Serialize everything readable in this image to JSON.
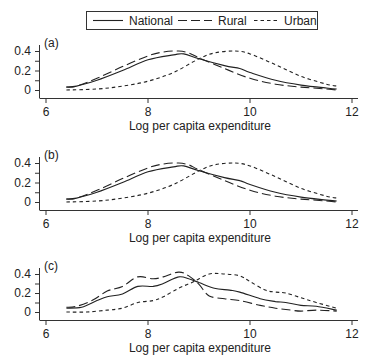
{
  "legend": {
    "entries": [
      {
        "name": "National",
        "style": "solid"
      },
      {
        "name": "Rural",
        "style": "long-dash"
      },
      {
        "name": "Urban",
        "style": "short-dash"
      }
    ]
  },
  "chart_data": [
    {
      "type": "line",
      "panel_label": "(a)",
      "title": "",
      "xlabel": "Log per capita expenditure",
      "ylabel": "",
      "xlim": [
        6,
        12
      ],
      "ylim": [
        0,
        0.4
      ],
      "x_ticks": [
        6,
        8,
        10,
        12
      ],
      "y_ticks": [
        0,
        0.2,
        0.4
      ],
      "y_tick_labels": [
        "0",
        "0.2",
        "0.4"
      ],
      "grid": false,
      "legend_position": "top",
      "series": [
        {
          "name": "National",
          "points": [
            [
              6.4,
              0.03
            ],
            [
              6.6,
              0.04
            ],
            [
              7.0,
              0.1
            ],
            [
              7.5,
              0.2
            ],
            [
              8.0,
              0.31
            ],
            [
              8.5,
              0.36
            ],
            [
              8.7,
              0.37
            ],
            [
              9.0,
              0.32
            ],
            [
              9.5,
              0.25
            ],
            [
              9.8,
              0.22
            ],
            [
              10.0,
              0.18
            ],
            [
              10.5,
              0.1
            ],
            [
              11.0,
              0.05
            ],
            [
              11.5,
              0.02
            ],
            [
              11.7,
              0.01
            ]
          ]
        },
        {
          "name": "Rural",
          "points": [
            [
              6.4,
              0.03
            ],
            [
              6.6,
              0.04
            ],
            [
              7.0,
              0.12
            ],
            [
              7.5,
              0.24
            ],
            [
              8.0,
              0.35
            ],
            [
              8.3,
              0.39
            ],
            [
              8.6,
              0.4
            ],
            [
              8.8,
              0.38
            ],
            [
              9.0,
              0.33
            ],
            [
              9.5,
              0.22
            ],
            [
              10.0,
              0.12
            ],
            [
              10.5,
              0.06
            ],
            [
              11.0,
              0.03
            ],
            [
              11.5,
              0.01
            ],
            [
              11.7,
              0.0
            ]
          ]
        },
        {
          "name": "Urban",
          "points": [
            [
              6.4,
              0.0
            ],
            [
              7.0,
              0.01
            ],
            [
              7.5,
              0.04
            ],
            [
              8.0,
              0.09
            ],
            [
              8.5,
              0.18
            ],
            [
              9.0,
              0.32
            ],
            [
              9.3,
              0.38
            ],
            [
              9.7,
              0.4
            ],
            [
              10.0,
              0.37
            ],
            [
              10.5,
              0.26
            ],
            [
              11.0,
              0.14
            ],
            [
              11.5,
              0.06
            ],
            [
              11.7,
              0.04
            ]
          ]
        }
      ]
    },
    {
      "type": "line",
      "panel_label": "(b)",
      "title": "",
      "xlabel": "Log per capita expenditure",
      "ylabel": "",
      "xlim": [
        6,
        12
      ],
      "ylim": [
        0,
        0.4
      ],
      "x_ticks": [
        6,
        8,
        10,
        12
      ],
      "y_ticks": [
        0,
        0.2,
        0.4
      ],
      "y_tick_labels": [
        "0",
        "0.2",
        "0.4"
      ],
      "grid": false,
      "series": [
        {
          "name": "National",
          "points": [
            [
              6.4,
              0.03
            ],
            [
              6.6,
              0.04
            ],
            [
              7.0,
              0.1
            ],
            [
              7.5,
              0.2
            ],
            [
              8.0,
              0.31
            ],
            [
              8.5,
              0.36
            ],
            [
              8.7,
              0.37
            ],
            [
              9.0,
              0.32
            ],
            [
              9.5,
              0.25
            ],
            [
              9.8,
              0.22
            ],
            [
              10.0,
              0.18
            ],
            [
              10.5,
              0.1
            ],
            [
              11.0,
              0.05
            ],
            [
              11.5,
              0.02
            ],
            [
              11.7,
              0.01
            ]
          ]
        },
        {
          "name": "Rural",
          "points": [
            [
              6.4,
              0.03
            ],
            [
              6.6,
              0.04
            ],
            [
              7.0,
              0.12
            ],
            [
              7.5,
              0.24
            ],
            [
              8.0,
              0.35
            ],
            [
              8.3,
              0.39
            ],
            [
              8.6,
              0.4
            ],
            [
              8.8,
              0.38
            ],
            [
              9.0,
              0.33
            ],
            [
              9.5,
              0.22
            ],
            [
              10.0,
              0.12
            ],
            [
              10.5,
              0.06
            ],
            [
              11.0,
              0.03
            ],
            [
              11.5,
              0.01
            ],
            [
              11.7,
              0.0
            ]
          ]
        },
        {
          "name": "Urban",
          "points": [
            [
              6.4,
              0.0
            ],
            [
              7.0,
              0.01
            ],
            [
              7.5,
              0.04
            ],
            [
              8.0,
              0.09
            ],
            [
              8.5,
              0.18
            ],
            [
              9.0,
              0.32
            ],
            [
              9.3,
              0.38
            ],
            [
              9.7,
              0.4
            ],
            [
              10.0,
              0.37
            ],
            [
              10.5,
              0.26
            ],
            [
              11.0,
              0.14
            ],
            [
              11.5,
              0.06
            ],
            [
              11.7,
              0.04
            ]
          ]
        }
      ]
    },
    {
      "type": "line",
      "panel_label": "(c)",
      "title": "",
      "xlabel": "Log per capita expenditure",
      "ylabel": "",
      "xlim": [
        6,
        12
      ],
      "ylim": [
        0,
        0.4
      ],
      "x_ticks": [
        6,
        8,
        10,
        12
      ],
      "y_ticks": [
        0,
        0.2,
        0.4
      ],
      "y_tick_labels": [
        "0",
        "0.2",
        "0.4"
      ],
      "grid": false,
      "series": [
        {
          "name": "National",
          "points": [
            [
              6.4,
              0.04
            ],
            [
              6.7,
              0.05
            ],
            [
              7.0,
              0.12
            ],
            [
              7.2,
              0.16
            ],
            [
              7.5,
              0.19
            ],
            [
              7.8,
              0.27
            ],
            [
              8.1,
              0.27
            ],
            [
              8.3,
              0.3
            ],
            [
              8.6,
              0.37
            ],
            [
              8.8,
              0.35
            ],
            [
              9.0,
              0.31
            ],
            [
              9.3,
              0.25
            ],
            [
              9.6,
              0.23
            ],
            [
              9.8,
              0.21
            ],
            [
              10.2,
              0.14
            ],
            [
              10.5,
              0.11
            ],
            [
              10.7,
              0.1
            ],
            [
              11.0,
              0.07
            ],
            [
              11.3,
              0.06
            ],
            [
              11.7,
              0.02
            ]
          ]
        },
        {
          "name": "Rural",
          "points": [
            [
              6.4,
              0.05
            ],
            [
              6.6,
              0.06
            ],
            [
              6.9,
              0.12
            ],
            [
              7.2,
              0.22
            ],
            [
              7.5,
              0.27
            ],
            [
              7.8,
              0.37
            ],
            [
              8.1,
              0.35
            ],
            [
              8.3,
              0.37
            ],
            [
              8.6,
              0.42
            ],
            [
              8.8,
              0.38
            ],
            [
              9.0,
              0.29
            ],
            [
              9.2,
              0.17
            ],
            [
              9.5,
              0.14
            ],
            [
              9.8,
              0.12
            ],
            [
              10.2,
              0.07
            ],
            [
              10.5,
              0.04
            ],
            [
              10.8,
              0.02
            ],
            [
              11.0,
              0.01
            ],
            [
              11.3,
              0.02
            ],
            [
              11.7,
              0.01
            ]
          ]
        },
        {
          "name": "Urban",
          "points": [
            [
              6.4,
              0.0
            ],
            [
              6.8,
              0.0
            ],
            [
              7.2,
              0.02
            ],
            [
              7.5,
              0.04
            ],
            [
              7.8,
              0.1
            ],
            [
              8.1,
              0.12
            ],
            [
              8.3,
              0.16
            ],
            [
              8.6,
              0.25
            ],
            [
              8.9,
              0.32
            ],
            [
              9.2,
              0.4
            ],
            [
              9.5,
              0.4
            ],
            [
              9.8,
              0.38
            ],
            [
              10.0,
              0.32
            ],
            [
              10.3,
              0.23
            ],
            [
              10.5,
              0.21
            ],
            [
              10.7,
              0.2
            ],
            [
              11.0,
              0.15
            ],
            [
              11.3,
              0.1
            ],
            [
              11.7,
              0.04
            ]
          ]
        }
      ]
    }
  ]
}
